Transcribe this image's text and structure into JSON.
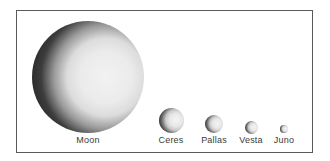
{
  "figure": {
    "title": "",
    "frame_color": "#5a5a5a",
    "label_color": "#3a3a3a"
  },
  "bodies": [
    {
      "name": "Moon",
      "label": "Moon",
      "cx": 88,
      "cy": 77,
      "r": 56
    },
    {
      "name": "Ceres",
      "label": "Ceres",
      "cx": 171,
      "cy": 120,
      "r": 12.5
    },
    {
      "name": "Pallas",
      "label": "Pallas",
      "cx": 214,
      "cy": 124,
      "r": 9
    },
    {
      "name": "Vesta",
      "label": "Vesta",
      "cx": 251,
      "cy": 127,
      "r": 6.5
    },
    {
      "name": "Juno",
      "label": "Juno",
      "cx": 284,
      "cy": 129,
      "r": 4
    }
  ]
}
